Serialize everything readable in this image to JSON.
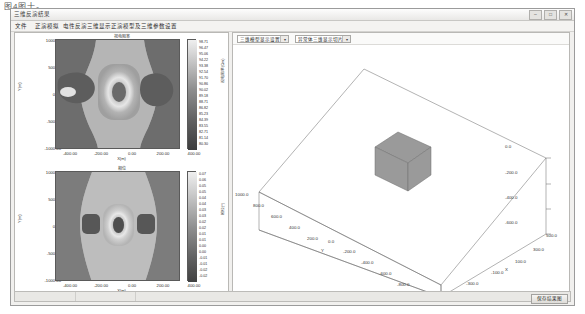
{
  "page": {
    "caption": "图4图十。"
  },
  "window": {
    "title": "三维反演结果",
    "controls": [
      {
        "name": "minimize",
        "glyph": "–"
      },
      {
        "name": "maximize",
        "glyph": "□"
      },
      {
        "name": "close",
        "glyph": "✕"
      }
    ]
  },
  "menubar": {
    "items": [
      {
        "label": "文件",
        "x": 4
      },
      {
        "label": "正演模拟",
        "x": 24
      },
      {
        "label": "电性反演",
        "x": 52
      },
      {
        "label": "三维显示",
        "x": 76
      },
      {
        "label": "正演模型及三维参数设置",
        "x": 100
      }
    ]
  },
  "toolbar3d": {
    "selectors": [
      {
        "name": "display-mode",
        "value": "三维模型显示设置",
        "x": 4,
        "width": 52
      },
      {
        "name": "slice-mode",
        "value": "异常体三维显示切片",
        "x": 62,
        "width": 56
      }
    ]
  },
  "plots": [
    {
      "id": "upper",
      "title": "视电阻率",
      "xlabel": "X(m)",
      "ylabel": "Y(m)",
      "xticks": [
        "-400.00",
        "-200.00",
        "0.00",
        "200.00",
        "400.00"
      ],
      "xvalues": [
        -400,
        -200,
        0,
        200,
        400
      ],
      "yticks": [
        "1000.00",
        "500.00",
        "0.00",
        "-500.00",
        "-1000.00"
      ],
      "yvalues": [
        1000,
        500,
        0,
        -500,
        -1000
      ],
      "colorbar": {
        "label": "视电阻率(Ωm)",
        "ticks": [
          "98.71",
          "96.47",
          "95.06",
          "94.22",
          "93.38",
          "92.54",
          "91.70",
          "90.86",
          "90.02",
          "89.18",
          "88.71",
          "86.82",
          "85.23",
          "84.39",
          "83.55",
          "82.71",
          "81.14",
          "80.30"
        ]
      }
    },
    {
      "id": "lower",
      "title": "相位",
      "xlabel": "X(m)",
      "ylabel": "Y(m)",
      "xticks": [
        "-400.00",
        "-200.00",
        "0.00",
        "200.00",
        "400.00"
      ],
      "xvalues": [
        -400,
        -200,
        0,
        200,
        400
      ],
      "yticks": [
        "1000.00",
        "500.00",
        "0.00",
        "-500.00",
        "-1000.00"
      ],
      "yvalues": [
        1000,
        500,
        0,
        -500,
        -1000
      ],
      "colorbar": {
        "label": "相位(°)",
        "ticks": [
          "0.07",
          "0.06",
          "0.05",
          "0.05",
          "0.04",
          "0.04",
          "0.03",
          "0.03",
          "0.02",
          "0.02",
          "0.01",
          "0.01",
          "0.00",
          "0.00",
          "-0.01",
          "-0.01",
          "-0.02",
          "-0.02"
        ]
      }
    }
  ],
  "view3d": {
    "axis_labels": {
      "x": "X",
      "y": "Y"
    },
    "x_ticks": [
      "-500.0",
      "-300.0",
      "-100.0",
      "100.0",
      "300.0",
      "500.0"
    ],
    "y_ticks": [
      "1000.0",
      "800.0",
      "600.0",
      "400.0",
      "200.0",
      "0.0",
      "-200.0",
      "-400.0",
      "-600.0",
      "-800.0",
      "-1000.0"
    ],
    "z_ticks": [
      "0.0",
      "-200.0",
      "-400.0",
      "-600.0"
    ],
    "block_color": "#9a9a9a"
  },
  "statusbar": {
    "button_label": "保存结果图"
  },
  "colors": {
    "window_bg": "#f1f0ee",
    "panel_bg": "#ffffff",
    "border": "#b9b8b5",
    "text": "#2d2d2d"
  }
}
